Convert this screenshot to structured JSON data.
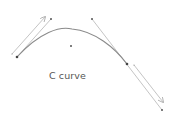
{
  "diagram": {
    "label": "C curve",
    "colors": {
      "curve": "#8a8a8a",
      "handle_line": "#b5b5b5",
      "point": "#444444",
      "label": "#555555"
    },
    "curve": {
      "start": [
        17,
        57
      ],
      "control1": [
        51,
        19
      ],
      "control2": [
        92,
        19
      ],
      "end": [
        127,
        64
      ]
    },
    "points": [
      {
        "name": "start-anchor",
        "x": 17,
        "y": 57
      },
      {
        "name": "control-point-1",
        "x": 51,
        "y": 19
      },
      {
        "name": "control-point-2",
        "x": 92,
        "y": 19
      },
      {
        "name": "end-anchor",
        "x": 127,
        "y": 64
      },
      {
        "name": "center-point",
        "x": 71,
        "y": 46
      },
      {
        "name": "end-extension-point",
        "x": 162,
        "y": 110
      }
    ],
    "arrows": [
      {
        "name": "start-direction-arrow",
        "from": [
          12,
          54
        ],
        "to": [
          45,
          17
        ]
      },
      {
        "name": "end-direction-arrow",
        "from": [
          134,
          65
        ],
        "to": [
          163,
          102
        ]
      }
    ]
  }
}
